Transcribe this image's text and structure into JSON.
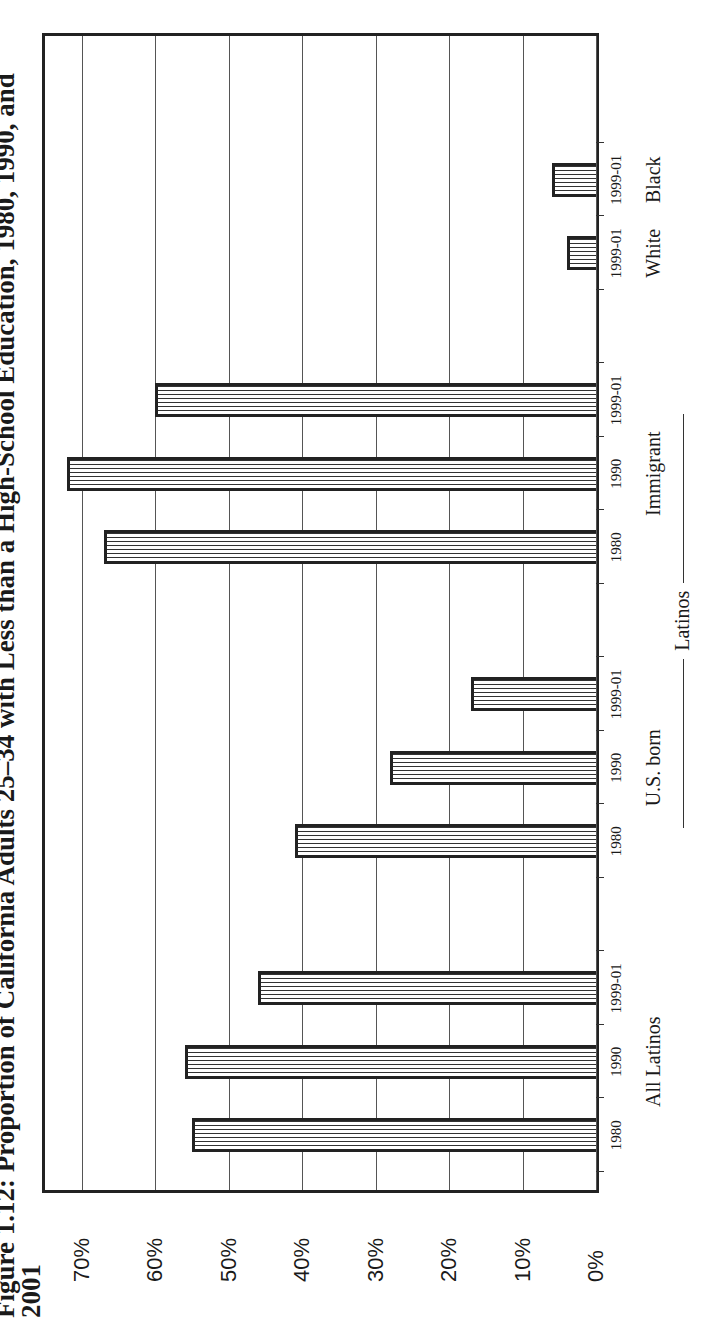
{
  "title": {
    "line1": "Figure 1.12: Proportion of California Adults 25–34 with Less than a High-School Education, 1980, 1990, and",
    "line2": "2001"
  },
  "y_ticks": [
    "0%",
    "10%",
    "20%",
    "30%",
    "40%",
    "50%",
    "60%",
    "70%"
  ],
  "groups": [
    {
      "label": "All Latinos",
      "bars": [
        {
          "label": "1980",
          "value": 55
        },
        {
          "label": "1990",
          "value": 56
        },
        {
          "label": "1999-01",
          "value": 46
        }
      ]
    },
    {
      "label": "U.S. born",
      "bars": [
        {
          "label": "1980",
          "value": 41
        },
        {
          "label": "1990",
          "value": 28
        },
        {
          "label": "1999-01",
          "value": 17
        }
      ]
    },
    {
      "label": "Immigrant",
      "bars": [
        {
          "label": "1980",
          "value": 67
        },
        {
          "label": "1990",
          "value": 72
        },
        {
          "label": "1999-01",
          "value": 60
        }
      ]
    },
    {
      "label": "White",
      "bars": [
        {
          "label": "1999-01",
          "value": 4
        }
      ]
    },
    {
      "label": "Black",
      "bars": [
        {
          "label": "1999-01",
          "value": 6
        }
      ]
    }
  ],
  "bracket": {
    "label": "Latinos"
  },
  "chart_data": {
    "type": "bar",
    "orientation": "vertical (page rotated 90° counter-clockwise)",
    "title": "Figure 1.12: Proportion of California Adults 25–34 with Less than a High-School Education, 1980, 1990, and 2001",
    "xlabel": "",
    "ylabel": "",
    "ylim": [
      0,
      75
    ],
    "y_ticks": [
      "0%",
      "10%",
      "20%",
      "30%",
      "40%",
      "50%",
      "60%",
      "70%"
    ],
    "grid": true,
    "legend": null,
    "categories": [
      "All Latinos 1980",
      "All Latinos 1990",
      "All Latinos 1999-01",
      "U.S. born 1980",
      "U.S. born 1990",
      "U.S. born 1999-01",
      "Immigrant 1980",
      "Immigrant 1990",
      "Immigrant 1999-01",
      "White 1999-01",
      "Black 1999-01"
    ],
    "values": [
      55,
      56,
      46,
      41,
      28,
      17,
      67,
      72,
      60,
      4,
      6
    ],
    "group_labels": [
      "All Latinos",
      "U.S. born",
      "Immigrant",
      "White",
      "Black"
    ],
    "annotations": [
      "Latinos (bracket spanning U.S. born and Immigrant)"
    ],
    "units": "percent"
  }
}
